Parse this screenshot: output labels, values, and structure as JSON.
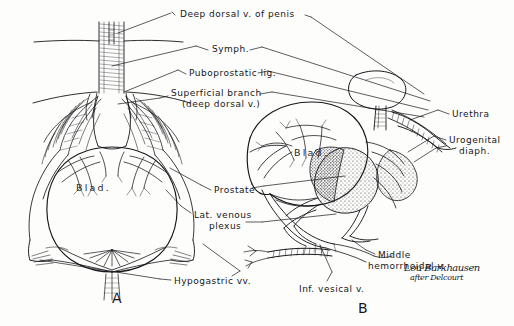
{
  "figure": {
    "background_color": "#fdfdfc",
    "ink_color": "#17171a",
    "panels": [
      {
        "id": "A",
        "label": "A",
        "view": "anterior",
        "x": 112,
        "y": 296
      },
      {
        "id": "B",
        "label": "B",
        "view": "lateral",
        "x": 358,
        "y": 306
      }
    ],
    "labels": [
      {
        "name": "deep-dorsal-vein-of-penis",
        "text": "Deep dorsal v. of penis",
        "x": 180,
        "y": 9,
        "align": "left",
        "lines": 1
      },
      {
        "name": "symphysis",
        "text": "Symph.",
        "x": 212,
        "y": 44,
        "align": "left",
        "lines": 1
      },
      {
        "name": "puboprostatic-ligament",
        "text": "Puboprostatic lig.",
        "x": 189,
        "y": 68,
        "align": "left",
        "lines": 1
      },
      {
        "name": "superficial-branch",
        "text": "Superficial branch",
        "x": 171,
        "y": 90,
        "align": "left",
        "lines": 1
      },
      {
        "name": "superficial-branch-sub",
        "text": "(deep dorsal v.)",
        "x": 182,
        "y": 100,
        "align": "left",
        "lines": 1
      },
      {
        "name": "prostate",
        "text": "Prostate",
        "x": 214,
        "y": 186,
        "align": "left",
        "lines": 1
      },
      {
        "name": "lateral-venous-plexus",
        "text": "Lat. venous",
        "x": 194,
        "y": 211,
        "align": "left",
        "lines": 1
      },
      {
        "name": "lateral-venous-plexus-sub",
        "text": "plexus",
        "x": 209,
        "y": 222,
        "align": "left",
        "lines": 1
      },
      {
        "name": "hypogastric-veins",
        "text": "Hypogastric vv.",
        "x": 174,
        "y": 277,
        "align": "left",
        "lines": 1
      },
      {
        "name": "urethra",
        "text": "Urethra",
        "x": 452,
        "y": 110,
        "align": "left",
        "lines": 1
      },
      {
        "name": "urogenital-diaphragm",
        "text": "Urogenital",
        "x": 449,
        "y": 136,
        "align": "left",
        "lines": 1
      },
      {
        "name": "urogenital-diaphragm-sub",
        "text": "diaph.",
        "x": 459,
        "y": 146,
        "align": "left",
        "lines": 1
      },
      {
        "name": "middle-hemorrhoidal-vein",
        "text": "Middle",
        "x": 378,
        "y": 251,
        "align": "left",
        "lines": 1
      },
      {
        "name": "middle-hemorrhoidal-vein-sub",
        "text": "hemorrhoidal v.",
        "x": 368,
        "y": 262,
        "align": "left",
        "lines": 1
      },
      {
        "name": "inferior-vesical-vein",
        "text": "Inf. vesical v.",
        "x": 299,
        "y": 285,
        "align": "left",
        "lines": 1
      }
    ],
    "organ_labels": [
      {
        "name": "bladder-label-a",
        "text": "Blad.",
        "x": 76,
        "y": 185
      },
      {
        "name": "bladder-label-b",
        "text": "Blad.",
        "x": 294,
        "y": 150
      }
    ],
    "signature": {
      "name": "artist-signature",
      "line1": "Lou Barkhausen",
      "line2": "after Delcourt",
      "x": 404,
      "y": 267
    }
  }
}
